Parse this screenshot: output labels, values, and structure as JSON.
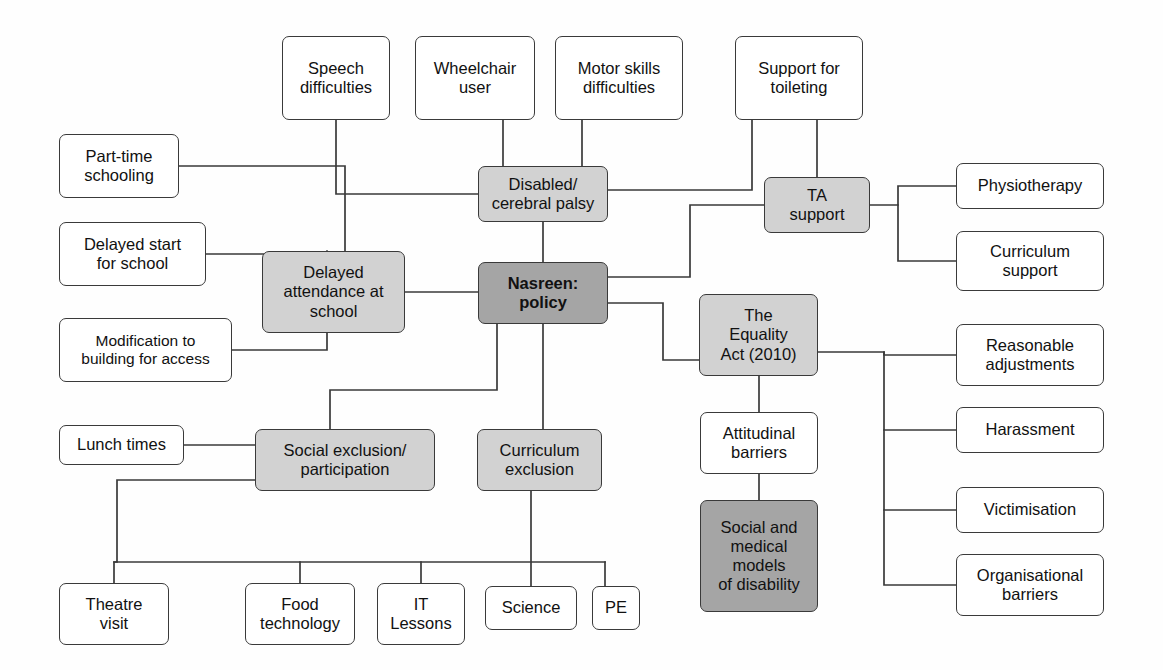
{
  "diagram": {
    "colors": {
      "light_gray": "#d2d2d2",
      "dark_gray": "#a5a5a5",
      "white": "#ffffff",
      "stroke": "#3a3a3a"
    },
    "nodes": [
      {
        "id": "speech",
        "label": "Speech\ndifficulties",
        "fill": "white",
        "x": 282,
        "y": 36,
        "w": 108,
        "h": 84,
        "bold": false
      },
      {
        "id": "wheelchair",
        "label": "Wheelchair\nuser",
        "fill": "white",
        "x": 415,
        "y": 36,
        "w": 120,
        "h": 84,
        "bold": false
      },
      {
        "id": "motor",
        "label": "Motor skills\ndifficulties",
        "fill": "white",
        "x": 555,
        "y": 36,
        "w": 128,
        "h": 84,
        "bold": false
      },
      {
        "id": "toileting",
        "label": "Support for\ntoileting",
        "fill": "white",
        "x": 735,
        "y": 36,
        "w": 128,
        "h": 84,
        "bold": false
      },
      {
        "id": "parttime",
        "label": "Part-time\nschooling",
        "fill": "white",
        "x": 59,
        "y": 134,
        "w": 120,
        "h": 64,
        "bold": false
      },
      {
        "id": "disabled",
        "label": "Disabled/\ncerebral palsy",
        "fill": "light",
        "x": 478,
        "y": 166,
        "w": 130,
        "h": 56,
        "bold": false
      },
      {
        "id": "ta",
        "label": "TA\nsupport",
        "fill": "light",
        "x": 764,
        "y": 177,
        "w": 106,
        "h": 56,
        "bold": false
      },
      {
        "id": "physio",
        "label": "Physiotherapy",
        "fill": "white",
        "x": 956,
        "y": 163,
        "w": 148,
        "h": 46,
        "bold": false
      },
      {
        "id": "delayedstart",
        "label": "Delayed start\nfor school",
        "fill": "white",
        "x": 59,
        "y": 222,
        "w": 147,
        "h": 64,
        "bold": false
      },
      {
        "id": "currsupport",
        "label": "Curriculum\nsupport",
        "fill": "white",
        "x": 956,
        "y": 231,
        "w": 148,
        "h": 60,
        "bold": false
      },
      {
        "id": "delayedatt",
        "label": "Delayed\nattendance at\nschool",
        "fill": "light",
        "x": 262,
        "y": 251,
        "w": 143,
        "h": 82,
        "bold": false
      },
      {
        "id": "nasreen",
        "label": "Nasreen:\npolicy",
        "fill": "dark",
        "x": 478,
        "y": 262,
        "w": 130,
        "h": 62,
        "bold": true
      },
      {
        "id": "equality",
        "label": "The\nEquality\nAct (2010)",
        "fill": "light",
        "x": 699,
        "y": 294,
        "w": 119,
        "h": 82,
        "bold": false
      },
      {
        "id": "modification",
        "label": "Modification to\nbuilding for access",
        "fill": "white",
        "x": 59,
        "y": 318,
        "w": 173,
        "h": 64,
        "bold": false
      },
      {
        "id": "reasonable",
        "label": "Reasonable\nadjustments",
        "fill": "white",
        "x": 956,
        "y": 324,
        "w": 148,
        "h": 62,
        "bold": false
      },
      {
        "id": "attitudinal",
        "label": "Attitudinal\nbarriers",
        "fill": "white",
        "x": 700,
        "y": 412,
        "w": 118,
        "h": 62,
        "bold": false
      },
      {
        "id": "lunch",
        "label": "Lunch times",
        "fill": "white",
        "x": 59,
        "y": 425,
        "w": 125,
        "h": 40,
        "bold": false
      },
      {
        "id": "socialexc",
        "label": "Social exclusion/\nparticipation",
        "fill": "light",
        "x": 255,
        "y": 429,
        "w": 180,
        "h": 62,
        "bold": false
      },
      {
        "id": "currexc",
        "label": "Curriculum\nexclusion",
        "fill": "light",
        "x": 477,
        "y": 429,
        "w": 125,
        "h": 62,
        "bold": false
      },
      {
        "id": "harassment",
        "label": "Harassment",
        "fill": "white",
        "x": 956,
        "y": 407,
        "w": 148,
        "h": 46,
        "bold": false
      },
      {
        "id": "victimisation",
        "label": "Victimisation",
        "fill": "white",
        "x": 956,
        "y": 487,
        "w": 148,
        "h": 46,
        "bold": false
      },
      {
        "id": "socialmedical",
        "label": "Social and\nmedical\nmodels\nof disability",
        "fill": "dark",
        "x": 700,
        "y": 500,
        "w": 118,
        "h": 112,
        "bold": false
      },
      {
        "id": "organisational",
        "label": "Organisational\nbarriers",
        "fill": "white",
        "x": 956,
        "y": 554,
        "w": 148,
        "h": 62,
        "bold": false
      },
      {
        "id": "theatre",
        "label": "Theatre\nvisit",
        "fill": "white",
        "x": 59,
        "y": 583,
        "w": 110,
        "h": 62,
        "bold": false
      },
      {
        "id": "food",
        "label": "Food\ntechnology",
        "fill": "white",
        "x": 245,
        "y": 583,
        "w": 110,
        "h": 62,
        "bold": false
      },
      {
        "id": "itlessons",
        "label": "IT\nLessons",
        "fill": "white",
        "x": 377,
        "y": 583,
        "w": 88,
        "h": 62,
        "bold": false
      },
      {
        "id": "science",
        "label": "Science",
        "fill": "white",
        "x": 485,
        "y": 586,
        "w": 92,
        "h": 44,
        "bold": false
      },
      {
        "id": "pe",
        "label": "PE",
        "fill": "white",
        "x": 592,
        "y": 586,
        "w": 48,
        "h": 44,
        "bold": false
      }
    ],
    "edges": [
      {
        "from": "speech",
        "to": "disabled",
        "kind": "elbow-down-right"
      },
      {
        "from": "wheelchair",
        "to": "disabled",
        "kind": "vertical"
      },
      {
        "from": "motor",
        "to": "disabled",
        "kind": "vertical"
      },
      {
        "from": "toileting",
        "to": "ta",
        "kind": "vertical"
      },
      {
        "from": "toileting",
        "to": "disabled",
        "kind": "elbow-down-left"
      },
      {
        "from": "disabled",
        "to": "ta",
        "kind": "horizontal-elbow"
      },
      {
        "from": "disabled",
        "to": "nasreen",
        "kind": "vertical"
      },
      {
        "from": "ta",
        "to": "physio",
        "kind": "branch-right"
      },
      {
        "from": "ta",
        "to": "currsupport",
        "kind": "branch-right"
      },
      {
        "from": "ta",
        "to": "nasreen",
        "kind": "elbow-left-down"
      },
      {
        "from": "parttime",
        "to": "delayedatt",
        "kind": "elbow-right-down"
      },
      {
        "from": "delayedstart",
        "to": "delayedatt",
        "kind": "elbow-right-down"
      },
      {
        "from": "modification",
        "to": "delayedatt",
        "kind": "elbow-right-up"
      },
      {
        "from": "delayedatt",
        "to": "nasreen",
        "kind": "horizontal"
      },
      {
        "from": "nasreen",
        "to": "equality",
        "kind": "elbow-right-down"
      },
      {
        "from": "nasreen",
        "to": "socialexc",
        "kind": "elbow-down-left"
      },
      {
        "from": "nasreen",
        "to": "currexc",
        "kind": "vertical"
      },
      {
        "from": "equality",
        "to": "attitudinal",
        "kind": "vertical"
      },
      {
        "from": "equality",
        "to": "reasonable",
        "kind": "branch-right"
      },
      {
        "from": "equality",
        "to": "harassment",
        "kind": "branch-right"
      },
      {
        "from": "equality",
        "to": "victimisation",
        "kind": "branch-right"
      },
      {
        "from": "equality",
        "to": "organisational",
        "kind": "branch-right"
      },
      {
        "from": "attitudinal",
        "to": "socialmedical",
        "kind": "vertical"
      },
      {
        "from": "lunch",
        "to": "socialexc",
        "kind": "horizontal"
      },
      {
        "from": "socialexc",
        "to": "theatre",
        "kind": "elbow-left-down"
      },
      {
        "from": "socialexc",
        "to": "food",
        "kind": "bus-down"
      },
      {
        "from": "socialexc",
        "to": "itlessons",
        "kind": "bus-down"
      },
      {
        "from": "currexc",
        "to": "science",
        "kind": "vertical"
      },
      {
        "from": "currexc",
        "to": "pe",
        "kind": "elbow-right-down"
      }
    ]
  }
}
